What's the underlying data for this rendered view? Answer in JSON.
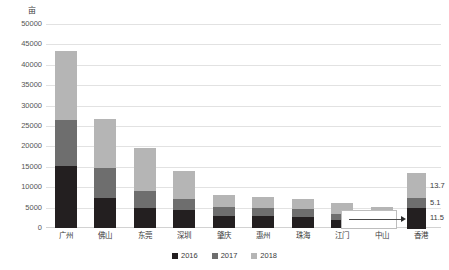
{
  "unit": {
    "label": "亩"
  },
  "chart_data": {
    "type": "bar",
    "subtype": "stacked-bar",
    "title": "",
    "xlabel": "",
    "ylabel": "亩",
    "ylim": [
      0,
      50000
    ],
    "ytick_step": 5000,
    "grid": true,
    "legend_position": "bottom",
    "categories": [
      "广州",
      "佛山",
      "东莞",
      "深圳",
      "肇庆",
      "惠州",
      "珠海",
      "江门",
      "中山",
      "香港"
    ],
    "ytick_labels": [
      "50000",
      "45000",
      "40000",
      "35000",
      "30000",
      "25000",
      "20000",
      "15000",
      "10000",
      "5000",
      "0"
    ],
    "series": [
      {
        "name": "2016",
        "color": "#231f20",
        "values": [
          15200,
          7300,
          5000,
          4400,
          3000,
          2900,
          2700,
          1900,
          1500,
          11.5
        ]
      },
      {
        "name": "2017",
        "color": "#6e6e6e",
        "values": [
          11300,
          7500,
          4000,
          2600,
          2100,
          2100,
          2000,
          1600,
          1300,
          5.1
        ]
      },
      {
        "name": "2018",
        "color": "#b5b5b5",
        "values": [
          17000,
          12000,
          10500,
          7000,
          3100,
          2700,
          2500,
          2600,
          2400,
          13.7
        ]
      }
    ],
    "totals": [
      43500,
      26800,
      19500,
      14000,
      8200,
      7700,
      7200,
      6100,
      5200,
      30.3
    ],
    "annotations": [
      {
        "type": "callout",
        "source_category": "香港",
        "description": "放大显示香港堆叠柱",
        "value_labels": [
          {
            "series": "2018",
            "text": "13.7"
          },
          {
            "series": "2017",
            "text": "5.1"
          },
          {
            "series": "2016",
            "text": "11.5"
          }
        ]
      }
    ]
  },
  "legend": {
    "items": [
      {
        "label": "2016",
        "color": "#231f20"
      },
      {
        "label": "2017",
        "color": "#6e6e6e"
      },
      {
        "label": "2018",
        "color": "#b5b5b5"
      }
    ]
  },
  "callout": {
    "arrow_icon": "arrow-right-icon"
  }
}
